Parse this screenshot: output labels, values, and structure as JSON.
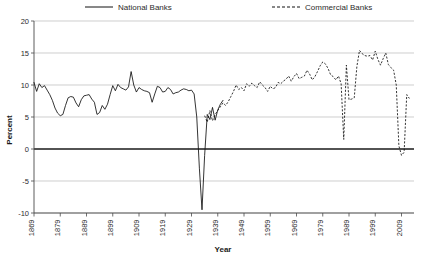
{
  "chart_data": {
    "type": "line",
    "title": "",
    "xlabel": "Year",
    "ylabel": "Percent",
    "xlim": [
      1869,
      2013
    ],
    "ylim": [
      -10,
      20
    ],
    "ytick_values": [
      -10,
      -5,
      0,
      5,
      10,
      15,
      20
    ],
    "ytick_labels": [
      "-10",
      "-5",
      "0",
      "5",
      "10",
      "15",
      "20"
    ],
    "xtick_values": [
      1869,
      1879,
      1889,
      1899,
      1909,
      1919,
      1929,
      1939,
      1949,
      1959,
      1969,
      1979,
      1989,
      1999,
      2009
    ],
    "xtick_labels": [
      "1869",
      "1879",
      "1889",
      "1899",
      "1909",
      "1919",
      "1929",
      "1939",
      "1949",
      "1959",
      "1969",
      "1979",
      "1989",
      "1999",
      "2009"
    ],
    "grid": true,
    "legend_position": "top",
    "legend": [
      {
        "name": "National Banks",
        "style": "solid",
        "color": "#111111"
      },
      {
        "name": "Commercial Banks",
        "style": "dashed",
        "color": "#111111"
      }
    ],
    "series": [
      {
        "name": "National Banks",
        "style": "solid",
        "color": "#111111",
        "x": [
          1869,
          1870,
          1871,
          1872,
          1873,
          1874,
          1875,
          1876,
          1877,
          1878,
          1879,
          1880,
          1881,
          1882,
          1883,
          1884,
          1885,
          1886,
          1887,
          1888,
          1889,
          1890,
          1891,
          1892,
          1893,
          1894,
          1895,
          1896,
          1897,
          1898,
          1899,
          1900,
          1901,
          1902,
          1903,
          1904,
          1905,
          1906,
          1907,
          1908,
          1909,
          1910,
          1911,
          1912,
          1913,
          1914,
          1915,
          1916,
          1917,
          1918,
          1919,
          1920,
          1921,
          1922,
          1923,
          1924,
          1925,
          1926,
          1927,
          1928,
          1929,
          1930,
          1931,
          1932,
          1933,
          1934,
          1935,
          1936,
          1937,
          1938,
          1939,
          1940,
          1941
        ],
        "y": [
          10.4,
          9.0,
          10.2,
          9.6,
          9.9,
          9.2,
          8.5,
          7.6,
          6.4,
          5.6,
          5.2,
          5.4,
          6.8,
          8.0,
          8.2,
          8.1,
          7.2,
          6.6,
          7.7,
          8.3,
          8.4,
          8.5,
          7.8,
          7.3,
          5.4,
          5.7,
          6.8,
          6.2,
          7.0,
          8.5,
          9.9,
          9.1,
          10.1,
          9.6,
          9.4,
          9.2,
          9.7,
          12.1,
          10.0,
          8.9,
          9.6,
          9.3,
          9.1,
          9.0,
          8.8,
          7.3,
          8.6,
          9.8,
          9.6,
          8.9,
          9.0,
          9.6,
          9.3,
          8.6,
          8.8,
          8.9,
          9.2,
          9.4,
          9.3,
          9.1,
          9.2,
          8.6,
          5.0,
          -3.0,
          -9.5,
          -1.0,
          5.4,
          4.6,
          6.5,
          4.5,
          6.1,
          7.0,
          7.6
        ]
      },
      {
        "name": "Commercial Banks",
        "style": "dashed",
        "color": "#111111",
        "x": [
          1934,
          1935,
          1936,
          1937,
          1938,
          1939,
          1940,
          1941,
          1942,
          1943,
          1944,
          1945,
          1946,
          1947,
          1948,
          1949,
          1950,
          1951,
          1952,
          1953,
          1954,
          1955,
          1956,
          1957,
          1958,
          1959,
          1960,
          1961,
          1962,
          1963,
          1964,
          1965,
          1966,
          1967,
          1968,
          1969,
          1970,
          1971,
          1972,
          1973,
          1974,
          1975,
          1976,
          1977,
          1978,
          1979,
          1980,
          1981,
          1982,
          1983,
          1984,
          1985,
          1986,
          1987,
          1988,
          1989,
          1990,
          1991,
          1992,
          1993,
          1994,
          1995,
          1996,
          1997,
          1998,
          1999,
          2000,
          2001,
          2002,
          2003,
          2004,
          2005,
          2006,
          2007,
          2008,
          2009,
          2010,
          2011,
          2012
        ],
        "y": [
          5.2,
          4.2,
          6.0,
          4.4,
          5.4,
          6.0,
          6.6,
          7.2,
          6.8,
          7.4,
          8.2,
          9.0,
          10.0,
          9.3,
          9.6,
          9.1,
          10.2,
          9.8,
          10.3,
          9.9,
          9.6,
          10.5,
          10.0,
          9.6,
          9.0,
          9.8,
          9.4,
          9.6,
          10.4,
          10.2,
          10.6,
          10.9,
          11.4,
          10.6,
          11.3,
          11.8,
          11.0,
          11.2,
          11.4,
          12.3,
          11.7,
          10.8,
          11.3,
          12.1,
          13.0,
          13.6,
          13.3,
          12.6,
          11.6,
          11.3,
          10.8,
          11.4,
          10.2,
          1.5,
          13.1,
          7.7,
          7.8,
          8.0,
          12.9,
          15.4,
          14.9,
          14.6,
          14.5,
          14.6,
          13.9,
          15.3,
          14.0,
          13.1,
          14.1,
          15.0,
          13.2,
          12.7,
          12.3,
          10.0,
          0.5,
          -1.0,
          -0.5,
          8.5,
          7.9
        ]
      }
    ]
  },
  "legend": {
    "national_label": "National Banks",
    "commercial_label": "Commercial Banks"
  },
  "axes": {
    "ylabel": "Percent",
    "xlabel": "Year"
  }
}
